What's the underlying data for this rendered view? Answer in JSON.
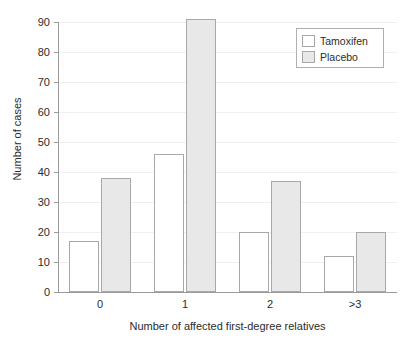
{
  "chart_data": {
    "type": "bar",
    "title": "",
    "xlabel": "Number of affected first-degree relatives",
    "ylabel": "Number of cases",
    "categories": [
      "0",
      "1",
      "2",
      ">3"
    ],
    "series": [
      {
        "name": "Tamoxifen",
        "values": [
          17,
          46,
          20,
          12
        ],
        "color": "#ffffff"
      },
      {
        "name": "Placebo",
        "values": [
          38,
          91,
          37,
          20
        ],
        "color": "#e8e8e8"
      }
    ],
    "ylim": [
      0,
      90
    ],
    "yticks": [
      0,
      10,
      20,
      30,
      40,
      50,
      60,
      70,
      80,
      90
    ],
    "ytick_labels": [
      "0",
      "10",
      "20",
      "30",
      "40",
      "50",
      "60",
      "70",
      "80",
      "90"
    ],
    "grid": true,
    "legend_position": "top-right"
  },
  "legend": {
    "entries": [
      {
        "label": "Tamoxifen",
        "swatch": "legend-swatch-tamoxifen"
      },
      {
        "label": "Placebo",
        "swatch": "legend-swatch-placebo"
      }
    ]
  }
}
